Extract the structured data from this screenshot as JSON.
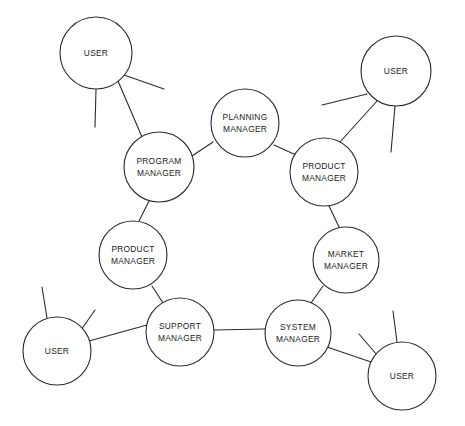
{
  "diagram": {
    "kind": "node-link-network-diagram",
    "canvas": {
      "width": 465,
      "height": 426,
      "background": "#ffffff"
    },
    "style": {
      "stroke": "#2b2b2b",
      "node_fill": "#ffffff",
      "label_color": "#1a1a1a"
    },
    "nodes": [
      {
        "id": "user-top-left",
        "role": "USER",
        "label_line1": "USER",
        "label_line2": "",
        "cx": 96,
        "cy": 53,
        "r": 36
      },
      {
        "id": "user-top-right",
        "role": "USER",
        "label_line1": "USER",
        "label_line2": "",
        "cx": 396,
        "cy": 71,
        "r": 35
      },
      {
        "id": "user-bottom-left",
        "role": "USER",
        "label_line1": "USER",
        "label_line2": "",
        "cx": 57,
        "cy": 351,
        "r": 34
      },
      {
        "id": "user-bottom-right",
        "role": "USER",
        "label_line1": "USER",
        "label_line2": "",
        "cx": 402,
        "cy": 376,
        "r": 34
      },
      {
        "id": "planning-manager",
        "role": "MANAGER",
        "label_line1": "PLANNING",
        "label_line2": "MANAGER",
        "cx": 245,
        "cy": 123,
        "r": 34
      },
      {
        "id": "program-manager",
        "role": "MANAGER",
        "label_line1": "PROGRAM",
        "label_line2": "MANAGER",
        "cx": 159,
        "cy": 167,
        "r": 35
      },
      {
        "id": "product-manager-right",
        "role": "MANAGER",
        "label_line1": "PRODUCT",
        "label_line2": "MANAGER",
        "cx": 324,
        "cy": 172,
        "r": 34
      },
      {
        "id": "product-manager-left",
        "role": "MANAGER",
        "label_line1": "PRODUCT",
        "label_line2": "MANAGER",
        "cx": 133,
        "cy": 255,
        "r": 34
      },
      {
        "id": "market-manager",
        "role": "MANAGER",
        "label_line1": "MARKET",
        "label_line2": "MANAGER",
        "cx": 346,
        "cy": 260,
        "r": 33
      },
      {
        "id": "support-manager",
        "role": "MANAGER",
        "label_line1": "SUPPORT",
        "label_line2": "MANAGER",
        "cx": 180,
        "cy": 332,
        "r": 34
      },
      {
        "id": "system-manager",
        "role": "MANAGER",
        "label_line1": "SYSTEM",
        "label_line2": "MANAGER",
        "cx": 298,
        "cy": 333,
        "r": 33
      }
    ],
    "edges": [
      {
        "id": "edge-program-planning",
        "from": "program-manager",
        "to": "planning-manager",
        "x1": 192,
        "y1": 156,
        "x2": 213,
        "y2": 142
      },
      {
        "id": "edge-planning-product-right",
        "from": "planning-manager",
        "to": "product-manager-right",
        "x1": 274,
        "y1": 145,
        "x2": 296,
        "y2": 155
      },
      {
        "id": "edge-product-right-market",
        "from": "product-manager-right",
        "to": "market-manager",
        "x1": 329,
        "y1": 206,
        "x2": 339,
        "y2": 227
      },
      {
        "id": "edge-market-system",
        "from": "market-manager",
        "to": "system-manager",
        "x1": 323,
        "y1": 286,
        "x2": 311,
        "y2": 303
      },
      {
        "id": "edge-system-support",
        "from": "system-manager",
        "to": "support-manager",
        "x1": 265,
        "y1": 329,
        "x2": 214,
        "y2": 330
      },
      {
        "id": "edge-support-product-left",
        "from": "support-manager",
        "to": "product-manager-left",
        "x1": 163,
        "y1": 303,
        "x2": 152,
        "y2": 286
      },
      {
        "id": "edge-product-left-program",
        "from": "product-manager-left",
        "to": "program-manager",
        "x1": 139,
        "y1": 221,
        "x2": 149,
        "y2": 201
      },
      {
        "id": "edge-user-top-left-program",
        "from": "user-top-left",
        "to": "program-manager",
        "x1": 118,
        "y1": 81,
        "x2": 142,
        "y2": 137
      },
      {
        "id": "edge-user-top-right-product-right",
        "from": "user-top-right",
        "to": "product-manager-right",
        "x1": 377,
        "y1": 101,
        "x2": 340,
        "y2": 142
      },
      {
        "id": "edge-user-bottom-left-support",
        "from": "user-bottom-left",
        "to": "support-manager",
        "x1": 89,
        "y1": 341,
        "x2": 147,
        "y2": 325
      },
      {
        "id": "edge-user-bottom-right-system",
        "from": "user-bottom-right",
        "to": "system-manager",
        "x1": 371,
        "y1": 362,
        "x2": 327,
        "y2": 347
      }
    ],
    "stubs": [
      {
        "id": "stub-user-top-left-a",
        "node": "user-top-left",
        "x1": 124,
        "y1": 75,
        "x2": 164,
        "y2": 89
      },
      {
        "id": "stub-user-top-left-b",
        "node": "user-top-left",
        "x1": 96,
        "y1": 89,
        "x2": 95,
        "y2": 127
      },
      {
        "id": "stub-user-top-right-a",
        "node": "user-top-right",
        "x1": 367,
        "y1": 94,
        "x2": 322,
        "y2": 105
      },
      {
        "id": "stub-user-top-right-b",
        "node": "user-top-right",
        "x1": 395,
        "y1": 106,
        "x2": 391,
        "y2": 152
      },
      {
        "id": "stub-user-bottom-left-a",
        "node": "user-bottom-left",
        "x1": 47,
        "y1": 318,
        "x2": 42,
        "y2": 287
      },
      {
        "id": "stub-user-bottom-left-b",
        "node": "user-bottom-left",
        "x1": 81,
        "y1": 330,
        "x2": 95,
        "y2": 310
      },
      {
        "id": "stub-user-bottom-right-a",
        "node": "user-bottom-right",
        "x1": 397,
        "y1": 342,
        "x2": 393,
        "y2": 311
      },
      {
        "id": "stub-user-bottom-right-b",
        "node": "user-bottom-right",
        "x1": 377,
        "y1": 355,
        "x2": 359,
        "y2": 334
      }
    ]
  }
}
